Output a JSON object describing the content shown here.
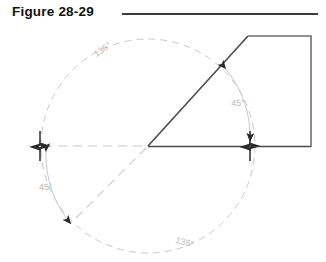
{
  "figure": {
    "title": "Figure 28-29",
    "rule": {
      "x": 122,
      "y": 13,
      "width": 196
    }
  },
  "colors": {
    "solid_line": "#4a4a4a",
    "construction_line": "#c9c9c9",
    "angle_label": "#b9b9b9",
    "arrow": "#2b2b2b",
    "title": "#111111",
    "background": "#ffffff"
  },
  "geometry": {
    "vertex": {
      "x": 148,
      "y": 146
    },
    "circle": {
      "cx": 148,
      "cy": 146,
      "r": 107
    },
    "baseline": {
      "x_start": 28,
      "x_end": 311,
      "y": 146
    },
    "ray_upper_right": {
      "x1": 148,
      "y1": 146,
      "x2": 248,
      "y2": 36
    },
    "ray_lower_left": {
      "x1": 148,
      "y1": 146,
      "x2": 71,
      "y2": 223
    },
    "polygon_points": "248,36 311,36 311,147 148,147"
  },
  "labels": {
    "angle_upper_left": "135°",
    "angle_upper_right": "45°",
    "angle_lower_left": "45°",
    "angle_lower_right": "135°"
  },
  "label_positions": {
    "angle_upper_left": {
      "x": 104,
      "y": 52
    },
    "angle_upper_right": {
      "x": 238,
      "y": 106
    },
    "angle_lower_left": {
      "x": 46,
      "y": 190
    },
    "angle_lower_right": {
      "x": 184,
      "y": 245
    }
  },
  "markers": {
    "tick_left": {
      "x": 40,
      "y": 146
    },
    "tick_right": {
      "x": 250,
      "y": 146
    },
    "arrow_pair_upper_right": {
      "x": 216,
      "y": 74
    },
    "arrow_pair_lower_left": {
      "x": 78,
      "y": 216
    }
  },
  "annotations": {
    "description": "Angular dimension layout: a 45 degree chamfer ray and its 135 degree complement about a horizontal centerline through a circular construction reference."
  }
}
